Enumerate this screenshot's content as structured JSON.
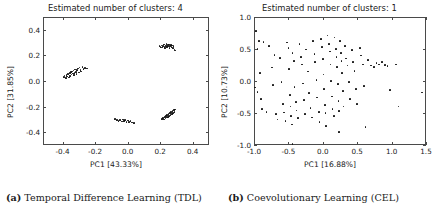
{
  "figure": {
    "panels": [
      {
        "id": "tdl",
        "title": "Estimated number of clusters: 4",
        "caption_label": "(a)",
        "caption_text": "Temporal Difference Learning (TDL)",
        "chart_data": {
          "type": "scatter",
          "title": "Estimated number of clusters: 4",
          "xlabel": "PC1 [43.33%]",
          "ylabel": "PC2 [31.85%]",
          "xlim": [
            -0.52,
            0.5
          ],
          "ylim": [
            -0.5,
            0.5
          ],
          "xticks": [
            -0.4,
            -0.2,
            0.0,
            0.2,
            0.4
          ],
          "xticklabels": [
            "-0.4",
            "-0.2",
            "0.0",
            "0.2",
            "0.4"
          ],
          "yticks": [
            -0.4,
            -0.2,
            0.0,
            0.2,
            0.4
          ],
          "yticklabels": [
            "-0.4",
            "-0.2",
            "0.0",
            "0.2",
            "0.4"
          ],
          "grid": false,
          "legend": false,
          "marker_color": "#111111",
          "estimated_clusters": 4,
          "points": [
            [
              -0.393,
              0.03
            ],
            [
              -0.388,
              0.044
            ],
            [
              -0.38,
              0.022
            ],
            [
              -0.376,
              0.048
            ],
            [
              -0.372,
              0.035
            ],
            [
              -0.366,
              0.052
            ],
            [
              -0.36,
              0.028
            ],
            [
              -0.356,
              0.06
            ],
            [
              -0.352,
              0.04
            ],
            [
              -0.348,
              0.068
            ],
            [
              -0.344,
              0.05
            ],
            [
              -0.34,
              0.075
            ],
            [
              -0.336,
              0.058
            ],
            [
              -0.332,
              0.082
            ],
            [
              -0.33,
              0.046
            ],
            [
              -0.326,
              0.064
            ],
            [
              -0.322,
              0.09
            ],
            [
              -0.318,
              0.072
            ],
            [
              -0.314,
              0.055
            ],
            [
              -0.31,
              0.084
            ],
            [
              -0.306,
              0.098
            ],
            [
              -0.3,
              0.066
            ],
            [
              -0.296,
              0.106
            ],
            [
              -0.29,
              0.088
            ],
            [
              -0.286,
              0.074
            ],
            [
              -0.278,
              0.112
            ],
            [
              -0.272,
              0.095
            ],
            [
              -0.262,
              0.104
            ],
            [
              -0.25,
              0.098
            ],
            [
              0.196,
              0.272
            ],
            [
              0.202,
              0.266
            ],
            [
              0.208,
              0.278
            ],
            [
              0.213,
              0.262
            ],
            [
              0.218,
              0.274
            ],
            [
              0.222,
              0.284
            ],
            [
              0.226,
              0.268
            ],
            [
              0.23,
              0.258
            ],
            [
              0.234,
              0.276
            ],
            [
              0.238,
              0.288
            ],
            [
              0.242,
              0.264
            ],
            [
              0.246,
              0.28
            ],
            [
              0.25,
              0.27
            ],
            [
              0.254,
              0.286
            ],
            [
              0.258,
              0.26
            ],
            [
              0.262,
              0.274
            ],
            [
              0.266,
              0.282
            ],
            [
              0.27,
              0.266
            ],
            [
              0.274,
              0.278
            ],
            [
              0.278,
              0.258
            ],
            [
              0.282,
              0.272
            ],
            [
              0.288,
              0.246
            ],
            [
              0.292,
              0.238
            ],
            [
              0.212,
              -0.296
            ],
            [
              0.218,
              -0.288
            ],
            [
              0.222,
              -0.3
            ],
            [
              0.228,
              -0.282
            ],
            [
              0.232,
              -0.292
            ],
            [
              0.236,
              -0.274
            ],
            [
              0.24,
              -0.286
            ],
            [
              0.244,
              -0.268
            ],
            [
              0.248,
              -0.28
            ],
            [
              0.252,
              -0.26
            ],
            [
              0.256,
              -0.272
            ],
            [
              0.26,
              -0.252
            ],
            [
              0.264,
              -0.264
            ],
            [
              0.268,
              -0.244
            ],
            [
              0.272,
              -0.256
            ],
            [
              0.276,
              -0.236
            ],
            [
              0.28,
              -0.248
            ],
            [
              0.284,
              -0.228
            ],
            [
              0.288,
              -0.24
            ],
            [
              0.292,
              -0.222
            ],
            [
              -0.076,
              -0.296
            ],
            [
              -0.066,
              -0.304
            ],
            [
              -0.056,
              -0.312
            ],
            [
              -0.046,
              -0.306
            ],
            [
              -0.036,
              -0.316
            ],
            [
              -0.03,
              -0.3
            ],
            [
              -0.022,
              -0.312
            ],
            [
              -0.014,
              -0.304
            ],
            [
              -0.006,
              -0.318
            ],
            [
              0.002,
              -0.308
            ],
            [
              0.01,
              -0.32
            ],
            [
              0.018,
              -0.312
            ],
            [
              0.028,
              -0.324
            ],
            [
              0.038,
              -0.33
            ]
          ]
        }
      },
      {
        "id": "cel",
        "title": "Estimated number of clusters: 1",
        "caption_label": "(b)",
        "caption_text": "Coevolutionary Learning (CEL)",
        "chart_data": {
          "type": "scatter",
          "title": "Estimated number of clusters: 1",
          "xlabel": "PC1 [16.88%]",
          "ylabel": "PC2 [10.73%]",
          "xlim": [
            -1.0,
            1.5
          ],
          "ylim": [
            -1.0,
            1.0
          ],
          "xticks": [
            -1.0,
            -0.5,
            0.0,
            0.5,
            1.0,
            1.5
          ],
          "xticklabels": [
            "-1.0",
            "-0.5",
            "0.0",
            "0.5",
            "1.0",
            "1.5"
          ],
          "yticks": [
            -1.0,
            -0.5,
            0.0,
            0.5,
            1.0
          ],
          "yticklabels": [
            "-1.0",
            "-0.5",
            "0.0",
            "0.5",
            "1.0"
          ],
          "grid": false,
          "legend": false,
          "marker_color": "#111111",
          "estimated_clusters": 1,
          "points": [
            [
              -0.97,
              0.78
            ],
            [
              -0.93,
              0.62
            ],
            [
              -0.86,
              0.61
            ],
            [
              -0.95,
              0.5
            ],
            [
              -0.91,
              0.12
            ],
            [
              -0.99,
              -0.1
            ],
            [
              -0.95,
              -0.17
            ],
            [
              -0.9,
              -0.28
            ],
            [
              -0.88,
              -0.44
            ],
            [
              -0.82,
              -0.48
            ],
            [
              -0.78,
              0.55
            ],
            [
              -0.74,
              0.21
            ],
            [
              -0.72,
              -0.06
            ],
            [
              -0.68,
              -0.52
            ],
            [
              -0.66,
              -0.6
            ],
            [
              -0.62,
              0.36
            ],
            [
              -0.6,
              -0.02
            ],
            [
              -0.58,
              -0.36
            ],
            [
              -0.56,
              -0.49
            ],
            [
              -0.54,
              -0.63
            ],
            [
              -0.52,
              0.6
            ],
            [
              -0.5,
              0.52
            ],
            [
              -0.49,
              0.19
            ],
            [
              -0.48,
              -0.22
            ],
            [
              -0.47,
              -0.4
            ],
            [
              -0.46,
              -0.55
            ],
            [
              -0.45,
              -0.68
            ],
            [
              -0.44,
              0.44
            ],
            [
              -0.42,
              0.31
            ],
            [
              -0.41,
              -0.09
            ],
            [
              -0.39,
              -0.33
            ],
            [
              -0.38,
              -0.46
            ],
            [
              -0.36,
              -0.58
            ],
            [
              -0.34,
              0.58
            ],
            [
              -0.32,
              0.38
            ],
            [
              -0.3,
              0.26
            ],
            [
              -0.29,
              -0.04
            ],
            [
              -0.27,
              -0.3
            ],
            [
              -0.26,
              -0.52
            ],
            [
              -0.24,
              0.49
            ],
            [
              -0.22,
              0.15
            ],
            [
              -0.2,
              -0.19
            ],
            [
              -0.18,
              -0.42
            ],
            [
              -0.16,
              -0.57
            ],
            [
              -0.14,
              0.63
            ],
            [
              -0.12,
              0.42
            ],
            [
              -0.11,
              0.3
            ],
            [
              -0.09,
              0.02
            ],
            [
              -0.08,
              -0.26
            ],
            [
              -0.06,
              -0.48
            ],
            [
              -0.05,
              -0.64
            ],
            [
              -0.03,
              0.66
            ],
            [
              -0.01,
              0.53
            ],
            [
              0.0,
              0.34
            ],
            [
              0.01,
              0.1
            ],
            [
              0.02,
              -0.13
            ],
            [
              0.03,
              -0.38
            ],
            [
              0.04,
              -0.5
            ],
            [
              0.05,
              -0.7
            ],
            [
              0.07,
              0.71
            ],
            [
              0.09,
              0.58
            ],
            [
              0.1,
              0.46
            ],
            [
              0.11,
              0.26
            ],
            [
              0.12,
              0.0
            ],
            [
              0.13,
              -0.24
            ],
            [
              0.14,
              -0.44
            ],
            [
              0.16,
              -0.55
            ],
            [
              0.17,
              0.68
            ],
            [
              0.19,
              0.5
            ],
            [
              0.2,
              0.38
            ],
            [
              0.21,
              0.22
            ],
            [
              0.22,
              -0.05
            ],
            [
              0.23,
              -0.31
            ],
            [
              0.24,
              -0.47
            ],
            [
              0.25,
              0.62
            ],
            [
              0.26,
              0.44
            ],
            [
              0.27,
              0.31
            ],
            [
              0.28,
              0.12
            ],
            [
              0.29,
              -0.16
            ],
            [
              0.3,
              -0.4
            ],
            [
              0.32,
              0.55
            ],
            [
              0.34,
              0.35
            ],
            [
              0.36,
              0.24
            ],
            [
              0.38,
              -0.02
            ],
            [
              0.4,
              -0.28
            ],
            [
              0.42,
              0.48
            ],
            [
              0.44,
              0.3
            ],
            [
              0.46,
              0.16
            ],
            [
              0.48,
              -0.12
            ],
            [
              0.5,
              -0.36
            ],
            [
              0.54,
              0.52
            ],
            [
              0.56,
              0.4
            ],
            [
              0.58,
              0.26
            ],
            [
              0.6,
              -0.08
            ],
            [
              0.62,
              -0.72
            ],
            [
              0.66,
              0.33
            ],
            [
              0.7,
              0.24
            ],
            [
              0.74,
              0.22
            ],
            [
              0.78,
              0.28
            ],
            [
              0.82,
              0.26
            ],
            [
              0.86,
              0.3
            ],
            [
              0.9,
              0.25
            ],
            [
              0.94,
              0.23
            ],
            [
              0.98,
              -0.14
            ],
            [
              1.06,
              0.26
            ],
            [
              1.1,
              -0.4
            ],
            [
              1.44,
              -0.18
            ],
            [
              -0.44,
              -0.98
            ],
            [
              0.24,
              -0.8
            ],
            [
              -0.7,
              0.41
            ]
          ]
        }
      }
    ]
  }
}
